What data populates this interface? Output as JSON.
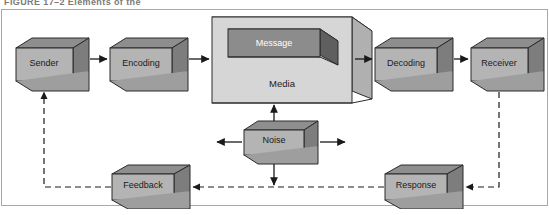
{
  "caption": {
    "text": "FIGURE 17–2   Elements of the"
  },
  "diagram": {
    "frame": {
      "present": true,
      "color": "#a8a8a8"
    },
    "colors": {
      "box_front": "#b4b4b4",
      "box_top": "#8e8e8e",
      "box_side": "#7d7d7d",
      "media_front": "#d6d6d6",
      "media_top": "#c2c2c2",
      "media_side": "#b0b0b0",
      "message_front": "#8c8c8c",
      "message_top": "#6e6e6e",
      "message_side": "#5f5f5f",
      "outline": "#2b2b2b",
      "arrow": "#1a1a1a",
      "dashed": "#4a4a4a",
      "background": "#ffffff"
    },
    "nodes": [
      {
        "id": "sender",
        "label": "Sender",
        "kind": "box"
      },
      {
        "id": "encoding",
        "label": "Encoding",
        "kind": "box"
      },
      {
        "id": "media",
        "label": "Media",
        "kind": "container"
      },
      {
        "id": "message",
        "label": "Message",
        "kind": "inner-box"
      },
      {
        "id": "decoding",
        "label": "Decoding",
        "kind": "box"
      },
      {
        "id": "receiver",
        "label": "Receiver",
        "kind": "box"
      },
      {
        "id": "noise",
        "label": "Noise",
        "kind": "box"
      },
      {
        "id": "feedback",
        "label": "Feedback",
        "kind": "box"
      },
      {
        "id": "response",
        "label": "Response",
        "kind": "box"
      }
    ],
    "edges": [
      {
        "from": "sender",
        "to": "encoding",
        "style": "solid",
        "arrow": "end"
      },
      {
        "from": "encoding",
        "to": "media",
        "style": "solid",
        "arrow": "end"
      },
      {
        "from": "media",
        "to": "decoding",
        "style": "solid",
        "arrow": "end"
      },
      {
        "from": "decoding",
        "to": "receiver",
        "style": "solid",
        "arrow": "end"
      },
      {
        "from": "noise",
        "to": "media",
        "style": "solid",
        "arrow": "end"
      },
      {
        "from": "noise",
        "to": "left",
        "style": "solid",
        "arrow": "end"
      },
      {
        "from": "noise",
        "to": "right",
        "style": "solid",
        "arrow": "end"
      },
      {
        "from": "noise",
        "to": "feedline",
        "style": "solid",
        "arrow": "end"
      },
      {
        "from": "receiver",
        "to": "response",
        "style": "dashed",
        "arrow": "end"
      },
      {
        "from": "response",
        "to": "feedback",
        "style": "dashed",
        "arrow": "end"
      },
      {
        "from": "feedback",
        "to": "sender",
        "style": "dashed",
        "arrow": "end"
      }
    ]
  }
}
